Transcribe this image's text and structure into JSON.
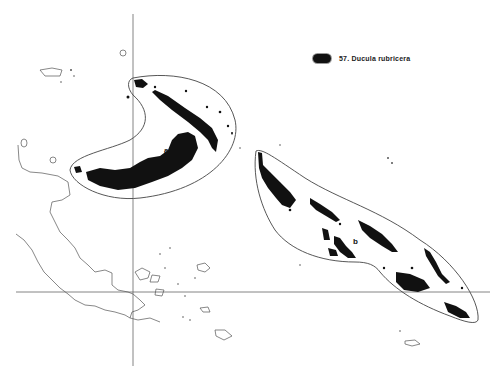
{
  "legend": {
    "label": "57. Ducula rubricera",
    "swatch_color": "#111111"
  },
  "regions": [
    {
      "id": "a",
      "label": "a"
    },
    {
      "id": "b",
      "label": "b"
    }
  ],
  "colors": {
    "background": "#ffffff",
    "range_fill": "#111111",
    "outline": "#444444",
    "coast": "#555555",
    "grid": "#666666"
  }
}
